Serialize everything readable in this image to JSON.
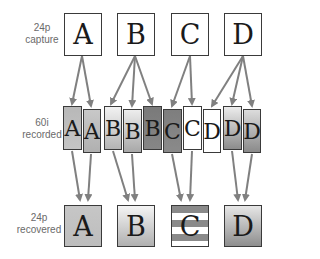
{
  "labels": {
    "capture": [
      "24p",
      "capture"
    ],
    "recorded": [
      "60i",
      "recorded"
    ],
    "recovered": [
      "24p",
      "recovered"
    ]
  },
  "capture_frames": [
    {
      "letter": "A",
      "x": 64,
      "fill": "#ffffff"
    },
    {
      "letter": "B",
      "x": 117,
      "fill": "#ffffff"
    },
    {
      "letter": "C",
      "x": 171,
      "fill": "#ffffff"
    },
    {
      "letter": "D",
      "x": 224,
      "fill": "#ffffff"
    }
  ],
  "recorded_fields": [
    {
      "letter": "A",
      "x": 63,
      "y": 106,
      "w": 19,
      "h": 44,
      "top": "#b8b8b8",
      "bottom": "#c4c4c4"
    },
    {
      "letter": "A",
      "x": 83,
      "y": 109,
      "w": 18,
      "h": 44,
      "top": "#c8c8c8",
      "bottom": "#b0b0b0"
    },
    {
      "letter": "B",
      "x": 104,
      "y": 106,
      "w": 18,
      "h": 44,
      "top": "#f2f2f2",
      "bottom": "#b4b4b4"
    },
    {
      "letter": "B",
      "x": 123,
      "y": 109,
      "w": 19,
      "h": 44,
      "top": "#ededed",
      "bottom": "#a8a8a8"
    },
    {
      "letter": "B",
      "x": 143,
      "y": 106,
      "w": 19,
      "h": 44,
      "top": "#7a7a7a",
      "bottom": "#868686"
    },
    {
      "letter": "C",
      "x": 163,
      "y": 109,
      "w": 19,
      "h": 44,
      "top": "#7e7e7e",
      "bottom": "#8a8a8a"
    },
    {
      "letter": "C",
      "x": 183,
      "y": 106,
      "w": 19,
      "h": 44,
      "top": "#ffffff",
      "bottom": "#ffffff"
    },
    {
      "letter": "D",
      "x": 203,
      "y": 109,
      "w": 18,
      "h": 44,
      "top": "#ffffff",
      "bottom": "#ffffff"
    },
    {
      "letter": "D",
      "x": 223,
      "y": 106,
      "w": 19,
      "h": 44,
      "top": "#ececec",
      "bottom": "#8c8c8c"
    },
    {
      "letter": "D",
      "x": 243,
      "y": 109,
      "w": 18,
      "h": 44,
      "top": "#dcdcdc",
      "bottom": "#8a8a8a"
    }
  ],
  "recovered_frames": [
    {
      "letter": "A",
      "x": 64,
      "style": "solid",
      "top": "#c6c6c6",
      "bottom": "#bdbdbd"
    },
    {
      "letter": "B",
      "x": 117,
      "style": "gradient",
      "top": "#f4f4f4",
      "bottom": "#b0b0b0"
    },
    {
      "letter": "C",
      "x": 171,
      "style": "striped",
      "top": "#8a8a8a",
      "bottom": "#ffffff"
    },
    {
      "letter": "D",
      "x": 224,
      "style": "gradient",
      "top": "#e6e6e6",
      "bottom": "#8e8e8e"
    }
  ],
  "arrows_top": [
    [
      82,
      56,
      72,
      104
    ],
    [
      82,
      56,
      91,
      106
    ],
    [
      135,
      56,
      111,
      104
    ],
    [
      135,
      56,
      132,
      106
    ],
    [
      135,
      56,
      152,
      104
    ],
    [
      190,
      56,
      172,
      106
    ],
    [
      190,
      56,
      192,
      104
    ],
    [
      243,
      56,
      212,
      106
    ],
    [
      243,
      56,
      232,
      104
    ],
    [
      243,
      56,
      252,
      106
    ]
  ],
  "arrows_bottom": [
    [
      72,
      151,
      80,
      200
    ],
    [
      91,
      154,
      88,
      200
    ],
    [
      113,
      151,
      128,
      200
    ],
    [
      132,
      154,
      135,
      200
    ],
    [
      172,
      154,
      181,
      200
    ],
    [
      192,
      151,
      190,
      200
    ],
    [
      232,
      151,
      238,
      200
    ],
    [
      252,
      154,
      245,
      200
    ]
  ],
  "colors": {
    "arrow": "#808080",
    "border": "#3a3a3a",
    "label": "#6a6a6a"
  }
}
